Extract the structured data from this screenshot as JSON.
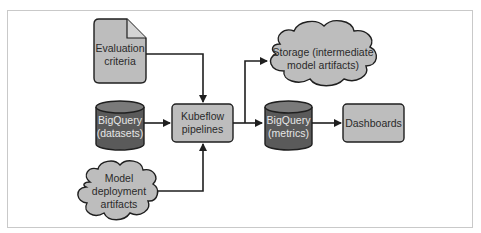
{
  "diagram": {
    "colors": {
      "light_fill": "#bdbdbd",
      "dark_fill": "#5a5a5a",
      "dark_top": "#7a7a7a",
      "stroke": "#1f1f1f",
      "frame": "#c9c9c9"
    },
    "nodes": {
      "evaluation_criteria": {
        "shape": "document",
        "lines": [
          "Evaluation",
          "criteria"
        ]
      },
      "bigquery_datasets": {
        "shape": "cylinder",
        "lines": [
          "BigQuery",
          "(datasets)"
        ]
      },
      "model_deployment_artifacts": {
        "shape": "cloud",
        "lines": [
          "Model",
          "deployment",
          "artifacts"
        ]
      },
      "kubeflow_pipelines": {
        "shape": "rounded-rect",
        "lines": [
          "Kubeflow",
          "pipelines"
        ]
      },
      "storage": {
        "shape": "cloud",
        "lines": [
          "Storage (intermediate",
          "model artifacts)"
        ]
      },
      "bigquery_metrics": {
        "shape": "cylinder",
        "lines": [
          "BigQuery",
          "(metrics)"
        ]
      },
      "dashboards": {
        "shape": "rounded-rect",
        "lines": [
          "Dashboards"
        ]
      }
    },
    "edges": [
      {
        "from": "evaluation_criteria",
        "to": "kubeflow_pipelines"
      },
      {
        "from": "bigquery_datasets",
        "to": "kubeflow_pipelines"
      },
      {
        "from": "model_deployment_artifacts",
        "to": "kubeflow_pipelines"
      },
      {
        "from": "kubeflow_pipelines",
        "to": "storage"
      },
      {
        "from": "kubeflow_pipelines",
        "to": "bigquery_metrics"
      },
      {
        "from": "bigquery_metrics",
        "to": "dashboards"
      }
    ]
  }
}
